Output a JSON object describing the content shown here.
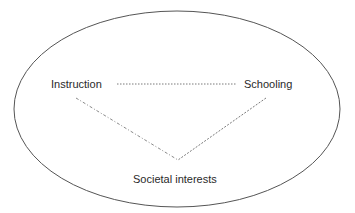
{
  "diagram": {
    "type": "relationship-triangle-in-ellipse",
    "nodes": [
      {
        "id": "instruction",
        "label": "Instruction"
      },
      {
        "id": "schooling",
        "label": "Schooling"
      },
      {
        "id": "societal_interests",
        "label": "Societal interests"
      }
    ],
    "edges": [
      {
        "from": "instruction",
        "to": "schooling",
        "style": "dotted"
      },
      {
        "from": "instruction",
        "to": "societal_interests",
        "style": "dash-dot"
      },
      {
        "from": "schooling",
        "to": "societal_interests",
        "style": "dotted"
      }
    ],
    "colors": {
      "ellipse": "#555555",
      "edge": "#7a7a7a",
      "text": "#2a2a2a",
      "background": "#ffffff"
    }
  }
}
